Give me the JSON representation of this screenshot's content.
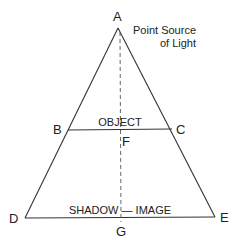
{
  "diagram": {
    "points": {
      "A": "A",
      "B": "B",
      "C": "C",
      "D": "D",
      "E": "E",
      "F": "F",
      "G": "G"
    },
    "annotations": {
      "source_line1": "Point Source",
      "source_line2": "of Light",
      "object": "OBJECT",
      "shadow_image": "SHADOW — IMAGE"
    },
    "colors": {
      "line": "#333333",
      "text": "#222222",
      "background": "#ffffff"
    }
  }
}
